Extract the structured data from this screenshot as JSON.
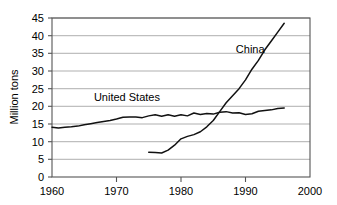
{
  "chart_data": {
    "type": "line",
    "title": "",
    "xlabel": "",
    "ylabel": "Million tons",
    "xlim": [
      1960,
      2000
    ],
    "ylim": [
      0,
      45
    ],
    "xticks": [
      1960,
      1970,
      1980,
      1990,
      2000
    ],
    "yticks": [
      0,
      5,
      10,
      15,
      20,
      25,
      30,
      35,
      40,
      45
    ],
    "grid": true,
    "legend_position": "inline-annotations",
    "annotations": [
      {
        "text": "United States",
        "x": 1966.5,
        "y": 21.5
      },
      {
        "text": "China",
        "x": 1988.5,
        "y": 35.0
      }
    ],
    "series": [
      {
        "name": "United States",
        "x": [
          1960,
          1961,
          1962,
          1963,
          1964,
          1965,
          1966,
          1967,
          1968,
          1969,
          1970,
          1971,
          1972,
          1973,
          1974,
          1975,
          1976,
          1977,
          1978,
          1979,
          1980,
          1981,
          1982,
          1983,
          1984,
          1985,
          1986,
          1987,
          1988,
          1989,
          1990,
          1991,
          1992,
          1993,
          1994,
          1995,
          1996
        ],
        "values": [
          14.1,
          13.9,
          14.1,
          14.2,
          14.4,
          14.8,
          15.1,
          15.4,
          15.7,
          16.0,
          16.4,
          16.9,
          17.0,
          17.0,
          16.8,
          17.3,
          17.6,
          17.2,
          17.6,
          17.2,
          17.6,
          17.3,
          18.1,
          17.7,
          18.0,
          17.8,
          18.3,
          18.5,
          18.1,
          18.2,
          17.7,
          17.9,
          18.6,
          18.8,
          19.0,
          19.4,
          19.5
        ]
      },
      {
        "name": "China",
        "x": [
          1975,
          1976,
          1977,
          1978,
          1979,
          1980,
          1981,
          1982,
          1983,
          1984,
          1985,
          1986,
          1987,
          1988,
          1989,
          1990,
          1991,
          1992,
          1993,
          1994,
          1995,
          1996
        ],
        "values": [
          7.0,
          6.9,
          6.8,
          7.6,
          9.0,
          10.8,
          11.5,
          12.0,
          12.8,
          14.2,
          16.0,
          18.5,
          21.0,
          23.0,
          25.0,
          27.5,
          30.5,
          33.0,
          36.0,
          38.5,
          41.0,
          43.5
        ]
      }
    ]
  },
  "axis": {
    "y_title": "Million tons",
    "y_tick_labels": [
      "45",
      "40",
      "35",
      "30",
      "25",
      "20",
      "15",
      "10",
      "5",
      "0"
    ],
    "x_tick_labels": [
      "1960",
      "1970",
      "1980",
      "1990",
      "2000"
    ]
  },
  "labels": {
    "united_states": "United States",
    "china": "China"
  }
}
